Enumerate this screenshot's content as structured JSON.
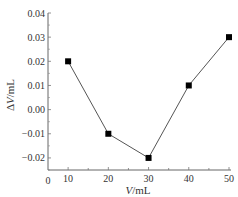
{
  "chart_data": {
    "type": "line",
    "title": "",
    "xlabel": "V/mL",
    "ylabel": "ΔV/mL",
    "x": [
      10,
      20,
      30,
      40,
      50
    ],
    "series": [
      {
        "name": "ΔV",
        "values": [
          0.02,
          -0.01,
          -0.02,
          0.01,
          0.03
        ],
        "marker": "square",
        "color": "#000000",
        "line_color": "#555555"
      }
    ],
    "xlim": [
      5,
      50
    ],
    "ylim": [
      -0.025,
      0.04
    ],
    "xticks": [
      "0",
      "10",
      "20",
      "30",
      "40",
      "50"
    ],
    "yticks": [
      "0.04",
      "0.03",
      "0.02",
      "0.01",
      "0.00",
      "-0.01",
      "-0.02"
    ],
    "grid": false,
    "legend": "none"
  },
  "labels": {
    "x_axis": "V/mL",
    "x_axis_var": "V",
    "x_axis_unit": "/mL",
    "y_axis_var": "ΔV",
    "y_axis_unit": "/mL",
    "origin": "0"
  }
}
